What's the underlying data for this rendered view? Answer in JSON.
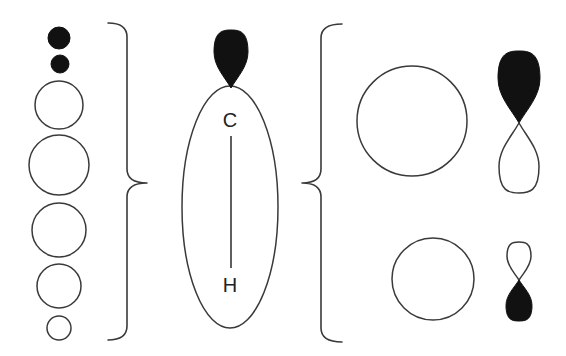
{
  "diagram": {
    "colors": {
      "background": "#ffffff",
      "outline": "#3a3a3a",
      "filled_lobe": "#111111"
    },
    "left_column_orbitals": [
      {
        "id": "small-filled-1",
        "cx": 59,
        "cy": 38,
        "r": 11,
        "filled": true
      },
      {
        "id": "small-filled-2",
        "cx": 60,
        "cy": 64,
        "r": 9,
        "filled": true
      },
      {
        "id": "circle-3",
        "cx": 59,
        "cy": 105,
        "r": 24,
        "filled": false
      },
      {
        "id": "circle-4",
        "cx": 59,
        "cy": 165,
        "r": 30,
        "filled": false
      },
      {
        "id": "circle-5",
        "cx": 59,
        "cy": 230,
        "r": 27,
        "filled": false
      },
      {
        "id": "circle-6",
        "cx": 59,
        "cy": 286,
        "r": 22,
        "filled": false
      },
      {
        "id": "circle-7",
        "cx": 59,
        "cy": 328,
        "r": 12,
        "filled": false
      }
    ],
    "center_bond": {
      "carbon_label": "C",
      "hydrogen_label": "H",
      "ellipse": {
        "cx": 230,
        "cy": 207,
        "rx": 48,
        "ry": 121
      },
      "top_lobe": {
        "cx": 231,
        "top": 30,
        "bottom": 88,
        "halfwidth": 17,
        "filled": true
      },
      "bond_line": {
        "x": 231,
        "y1": 136,
        "y2": 268
      },
      "carbon_pos": {
        "x": 230,
        "y": 120
      },
      "hydrogen_pos": {
        "x": 230,
        "y": 285
      }
    },
    "right_group": {
      "upper_s_orbital": {
        "cx": 412,
        "cy": 121,
        "r": 55
      },
      "upper_p_orbital": {
        "cx": 519,
        "node_y": 123,
        "top_lobe": {
          "extent": 72,
          "halfwidth": 21,
          "filled": true
        },
        "bottom_lobe": {
          "extent": 70,
          "halfwidth": 20,
          "filled": false
        }
      },
      "lower_s_orbital": {
        "cx": 433,
        "cy": 279,
        "r": 41
      },
      "lower_p_orbital": {
        "cx": 519,
        "node_y": 280,
        "top_lobe": {
          "extent": 38,
          "halfwidth": 12,
          "filled": false
        },
        "bottom_lobe": {
          "extent": 41,
          "halfwidth": 13,
          "filled": true
        }
      }
    },
    "braces": [
      {
        "id": "brace-right-facing",
        "direction": "right",
        "x_tip": 108,
        "x_spine": 127,
        "x_point": 147,
        "y_top": 23,
        "y_mid": 183,
        "y_bottom": 340
      },
      {
        "id": "brace-left-facing",
        "direction": "left",
        "x_tip": 342,
        "x_spine": 321,
        "x_point": 302,
        "y_top": 24,
        "y_mid": 183,
        "y_bottom": 342
      }
    ]
  }
}
